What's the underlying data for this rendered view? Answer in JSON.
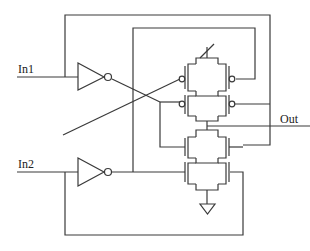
{
  "diagram": {
    "type": "CMOS transistor-level schematic",
    "labels": {
      "in1": "In1",
      "in2": "In2",
      "out": "Out"
    },
    "components": [
      {
        "id": "inv1",
        "kind": "inverter",
        "input": "In1"
      },
      {
        "id": "inv2",
        "kind": "inverter",
        "input": "In2"
      },
      {
        "id": "pmos-network",
        "kind": "pull-up",
        "count": 4
      },
      {
        "id": "nmos-network",
        "kind": "pull-down",
        "count": 4
      },
      {
        "id": "vdd",
        "kind": "supply"
      },
      {
        "id": "gnd",
        "kind": "ground"
      }
    ],
    "colors": {
      "line": "#3a3a3a",
      "background": "#ffffff",
      "text": "#222222"
    }
  }
}
